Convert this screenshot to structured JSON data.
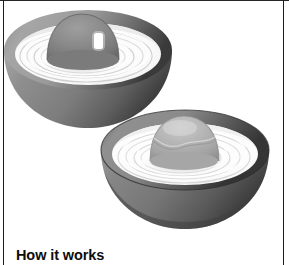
{
  "page": {
    "caption": "How it works",
    "background_color": "#ffffff",
    "rule_color": "#1d1d1d"
  },
  "illustration": {
    "name": "two-bowls-with-domes-illustration",
    "description": "Pencil-shaded drawing of two hemispherical bowls filled with white liquid, each containing a rounded dome shape, with concentric ripples on the liquid surface",
    "objects": [
      {
        "name": "back-bowl",
        "rim_color": "#9a9a9a",
        "rim_shadow_color": "#4a4a4a",
        "wall_color": "#8f8f8f",
        "wall_shadow_color": "#5a5a5a",
        "liquid_color": "#fdfdfd",
        "ripple_color": "#cfcfcf",
        "dome_color": "#8b8b8b",
        "dome_shadow_color": "#6a6a6a",
        "highlight_color": "#ffffff"
      },
      {
        "name": "front-bowl",
        "rim_color": "#8e8e8e",
        "rim_shadow_color": "#3f3f3f",
        "wall_color": "#858585",
        "wall_shadow_color": "#4d4d4d",
        "liquid_color": "#fdfdfd",
        "ripple_color": "#d2d2d2",
        "dome_color": "#b3b3b3",
        "dome_shadow_color": "#8d8d8d",
        "highlight_color": "#e6e6e6"
      }
    ]
  }
}
